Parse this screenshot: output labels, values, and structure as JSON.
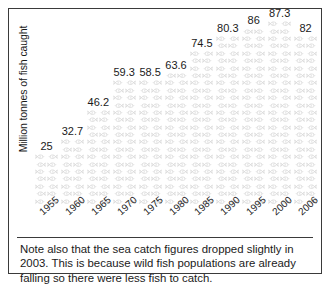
{
  "chart_data": {
    "type": "bar",
    "subtype": "pictograph-fish",
    "title": "",
    "xlabel": "",
    "ylabel": "Million tonnes of fish caught",
    "categories": [
      "1955",
      "1960",
      "1965",
      "1970",
      "1975",
      "1980",
      "1985",
      "1990",
      "1995",
      "2000",
      "2006"
    ],
    "values": [
      25,
      32.7,
      46.2,
      59.3,
      58.5,
      63.6,
      74.5,
      80.3,
      86,
      87.3,
      82
    ],
    "value_labels": [
      "25",
      "32.7",
      "46.2",
      "59.3",
      "58.5",
      "63.6",
      "74.5",
      "80.3",
      "86",
      "87.3",
      "82"
    ],
    "ylim": [
      0,
      93
    ],
    "grid": false,
    "legend": null,
    "marker_icon": "fish-icon",
    "marker_color": "#c8c8c8",
    "series": [
      {
        "name": "Million tonnes of fish caught",
        "values": [
          25,
          32.7,
          46.2,
          59.3,
          58.5,
          63.6,
          74.5,
          80.3,
          86,
          87.3,
          82
        ]
      }
    ]
  },
  "figure": {
    "caption": "Note also that the sea catch figures dropped slightly in 2003. This is because wild fish populations are already falling so there were less fish to catch.",
    "border_color": "#3a3a3a",
    "background_color": "#ffffff",
    "text_color": "#1a1a1a"
  }
}
